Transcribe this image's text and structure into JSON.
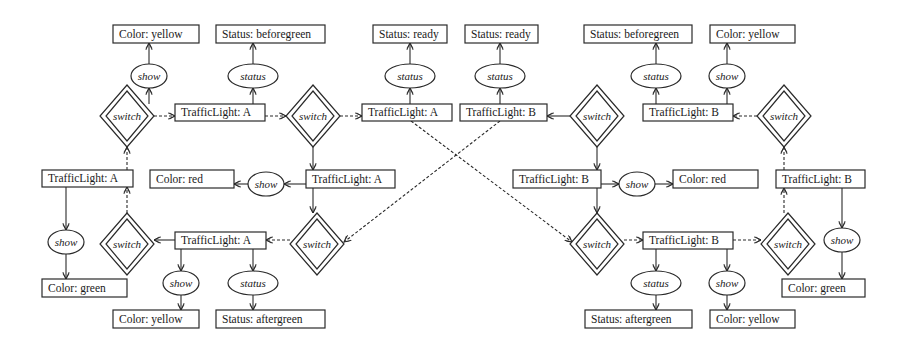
{
  "diagram": {
    "colors": {
      "stroke": "#2a2a2a",
      "background": "#ffffff",
      "text": "#1a1a1a"
    },
    "nodes": {
      "n1": {
        "type": "box",
        "label": "Color: yellow",
        "x": 113,
        "y": 25,
        "w": 86,
        "h": 18
      },
      "n2": {
        "type": "box",
        "label": "Status: beforegreen",
        "x": 216,
        "y": 25,
        "w": 109,
        "h": 18
      },
      "n3": {
        "type": "box",
        "label": "Status: ready",
        "x": 373,
        "y": 25,
        "w": 74,
        "h": 18
      },
      "n4": {
        "type": "box",
        "label": "Status: ready",
        "x": 465,
        "y": 25,
        "w": 73,
        "h": 18
      },
      "n5": {
        "type": "box",
        "label": "Status: beforegreen",
        "x": 584,
        "y": 25,
        "w": 108,
        "h": 18
      },
      "n6": {
        "type": "box",
        "label": "Color: yellow",
        "x": 710,
        "y": 25,
        "w": 85,
        "h": 18
      },
      "o1": {
        "type": "op",
        "label": "show",
        "cx": 149,
        "cy": 76,
        "rx": 18,
        "ry": 12
      },
      "o2": {
        "type": "op",
        "label": "status",
        "cx": 253,
        "cy": 76,
        "rx": 25,
        "ry": 12
      },
      "o3": {
        "type": "op",
        "label": "status",
        "cx": 410,
        "cy": 76,
        "rx": 25,
        "ry": 12
      },
      "o4": {
        "type": "op",
        "label": "status",
        "cx": 500,
        "cy": 76,
        "rx": 25,
        "ry": 12
      },
      "o5": {
        "type": "op",
        "label": "status",
        "cx": 656,
        "cy": 76,
        "rx": 25,
        "ry": 12
      },
      "o6": {
        "type": "op",
        "label": "show",
        "cx": 727,
        "cy": 76,
        "rx": 18,
        "ry": 12
      },
      "t1": {
        "type": "box",
        "label": "TrafficLight: A",
        "x": 175,
        "y": 104,
        "w": 90,
        "h": 17
      },
      "t2": {
        "type": "box",
        "label": "TrafficLight: A",
        "x": 362,
        "y": 104,
        "w": 90,
        "h": 17
      },
      "t3": {
        "type": "box",
        "label": "TrafficLight: B",
        "x": 460,
        "y": 104,
        "w": 87,
        "h": 17
      },
      "t4": {
        "type": "box",
        "label": "TrafficLight: B",
        "x": 643,
        "y": 104,
        "w": 90,
        "h": 17
      },
      "s1": {
        "type": "switch",
        "label": "switch",
        "cx": 127,
        "cy": 116
      },
      "s2": {
        "type": "switch",
        "label": "switch",
        "cx": 313,
        "cy": 116
      },
      "s3": {
        "type": "switch",
        "label": "switch",
        "cx": 597,
        "cy": 116
      },
      "s4": {
        "type": "switch",
        "label": "switch",
        "cx": 784,
        "cy": 116
      },
      "t5": {
        "type": "box",
        "label": "TrafficLight: A",
        "x": 42,
        "y": 170,
        "w": 91,
        "h": 17
      },
      "n7": {
        "type": "box",
        "label": "Color: red",
        "x": 150,
        "y": 170,
        "w": 84,
        "h": 18
      },
      "o7": {
        "type": "op",
        "label": "show",
        "cx": 266,
        "cy": 184,
        "rx": 18,
        "ry": 12
      },
      "t6": {
        "type": "box",
        "label": "TrafficLight: A",
        "x": 306,
        "y": 170,
        "w": 89,
        "h": 18
      },
      "t7": {
        "type": "box",
        "label": "TrafficLight: B",
        "x": 513,
        "y": 170,
        "w": 88,
        "h": 18
      },
      "o8": {
        "type": "op",
        "label": "show",
        "cx": 637,
        "cy": 184,
        "rx": 18,
        "ry": 12
      },
      "n8": {
        "type": "box",
        "label": "Color: red",
        "x": 673,
        "y": 170,
        "w": 85,
        "h": 18
      },
      "t8": {
        "type": "box",
        "label": "TrafficLight: B",
        "x": 776,
        "y": 170,
        "w": 89,
        "h": 18
      },
      "o9": {
        "type": "op",
        "label": "show",
        "cx": 66,
        "cy": 242,
        "rx": 18,
        "ry": 12
      },
      "s5": {
        "type": "switch",
        "label": "switch",
        "cx": 127,
        "cy": 244
      },
      "t9": {
        "type": "box",
        "label": "TrafficLight: A",
        "x": 175,
        "y": 232,
        "w": 91,
        "h": 17
      },
      "s6": {
        "type": "switch",
        "label": "switch",
        "cx": 317,
        "cy": 244
      },
      "s7": {
        "type": "switch",
        "label": "switch",
        "cx": 597,
        "cy": 244
      },
      "t10": {
        "type": "box",
        "label": "TrafficLight: B",
        "x": 643,
        "y": 232,
        "w": 90,
        "h": 17
      },
      "s8": {
        "type": "switch",
        "label": "switch",
        "cx": 788,
        "cy": 244
      },
      "o10": {
        "type": "op",
        "label": "show",
        "cx": 842,
        "cy": 240,
        "rx": 18,
        "ry": 12
      },
      "n9": {
        "type": "box",
        "label": "Color: green",
        "x": 42,
        "y": 279,
        "w": 85,
        "h": 18
      },
      "n10": {
        "type": "box",
        "label": "Color: green",
        "x": 782,
        "y": 279,
        "w": 83,
        "h": 18
      },
      "o11": {
        "type": "op",
        "label": "show",
        "cx": 181,
        "cy": 283,
        "rx": 18,
        "ry": 12
      },
      "o12": {
        "type": "op",
        "label": "status",
        "cx": 253,
        "cy": 283,
        "rx": 25,
        "ry": 12
      },
      "o13": {
        "type": "op",
        "label": "status",
        "cx": 656,
        "cy": 283,
        "rx": 25,
        "ry": 12
      },
      "o14": {
        "type": "op",
        "label": "show",
        "cx": 727,
        "cy": 283,
        "rx": 18,
        "ry": 12
      },
      "n11": {
        "type": "box",
        "label": "Color: yellow",
        "x": 113,
        "y": 310,
        "w": 86,
        "h": 18
      },
      "n12": {
        "type": "box",
        "label": "Status: aftergreen",
        "x": 216,
        "y": 310,
        "w": 109,
        "h": 18
      },
      "n13": {
        "type": "box",
        "label": "Status: aftergreen",
        "x": 585,
        "y": 310,
        "w": 107,
        "h": 18
      },
      "n14": {
        "type": "box",
        "label": "Color: yellow",
        "x": 710,
        "y": 310,
        "w": 85,
        "h": 18
      }
    },
    "edges": [
      {
        "from": [
          149,
          104
        ],
        "to": [
          149,
          88
        ],
        "style": "solid"
      },
      {
        "from": [
          149,
          64
        ],
        "to": [
          149,
          43
        ],
        "style": "solid"
      },
      {
        "from": [
          253,
          104
        ],
        "to": [
          253,
          88
        ],
        "style": "solid"
      },
      {
        "from": [
          253,
          64
        ],
        "to": [
          253,
          43
        ],
        "style": "solid"
      },
      {
        "from": [
          410,
          104
        ],
        "to": [
          410,
          88
        ],
        "style": "solid"
      },
      {
        "from": [
          410,
          64
        ],
        "to": [
          410,
          43
        ],
        "style": "solid"
      },
      {
        "from": [
          500,
          104
        ],
        "to": [
          500,
          88
        ],
        "style": "solid"
      },
      {
        "from": [
          500,
          64
        ],
        "to": [
          500,
          43
        ],
        "style": "solid"
      },
      {
        "from": [
          656,
          104
        ],
        "to": [
          656,
          88
        ],
        "style": "solid"
      },
      {
        "from": [
          656,
          64
        ],
        "to": [
          656,
          43
        ],
        "style": "solid"
      },
      {
        "from": [
          727,
          104
        ],
        "to": [
          727,
          88
        ],
        "style": "solid"
      },
      {
        "from": [
          727,
          64
        ],
        "to": [
          727,
          43
        ],
        "style": "solid"
      },
      {
        "from": [
          154,
          116
        ],
        "to": [
          175,
          116
        ],
        "style": "dashed"
      },
      {
        "from": [
          265,
          116
        ],
        "to": [
          286,
          116
        ],
        "style": "dashed"
      },
      {
        "from": [
          340,
          116
        ],
        "to": [
          362,
          116
        ],
        "style": "dashed"
      },
      {
        "from": [
          570,
          116
        ],
        "to": [
          547,
          116
        ],
        "style": "solid"
      },
      {
        "from": [
          757,
          116
        ],
        "to": [
          733,
          116
        ],
        "style": "dashed"
      },
      {
        "from": [
          127,
          170
        ],
        "to": [
          127,
          147
        ],
        "style": "dashed"
      },
      {
        "from": [
          313,
          147
        ],
        "to": [
          313,
          170
        ],
        "style": "solid"
      },
      {
        "from": [
          597,
          147
        ],
        "to": [
          597,
          170
        ],
        "style": "solid"
      },
      {
        "from": [
          784,
          170
        ],
        "to": [
          784,
          147
        ],
        "style": "dashed"
      },
      {
        "from": [
          306,
          184
        ],
        "to": [
          284,
          184
        ],
        "style": "solid"
      },
      {
        "from": [
          248,
          184
        ],
        "to": [
          234,
          184
        ],
        "style": "solid"
      },
      {
        "from": [
          601,
          184
        ],
        "to": [
          619,
          184
        ],
        "style": "solid"
      },
      {
        "from": [
          655,
          184
        ],
        "to": [
          673,
          184
        ],
        "style": "solid"
      },
      {
        "from": [
          66,
          187
        ],
        "to": [
          66,
          230
        ],
        "style": "solid"
      },
      {
        "from": [
          66,
          254
        ],
        "to": [
          66,
          279
        ],
        "style": "solid"
      },
      {
        "from": [
          842,
          188
        ],
        "to": [
          842,
          228
        ],
        "style": "solid"
      },
      {
        "from": [
          842,
          252
        ],
        "to": [
          842,
          279
        ],
        "style": "solid"
      },
      {
        "from": [
          127,
          213
        ],
        "to": [
          127,
          187
        ],
        "style": "dashed"
      },
      {
        "from": [
          175,
          240
        ],
        "to": [
          154,
          240
        ],
        "style": "solid"
      },
      {
        "from": [
          290,
          240
        ],
        "to": [
          266,
          240
        ],
        "style": "dashed"
      },
      {
        "from": [
          313,
          188
        ],
        "to": [
          313,
          213
        ],
        "style": "solid"
      },
      {
        "from": [
          597,
          188
        ],
        "to": [
          597,
          213
        ],
        "style": "solid"
      },
      {
        "from": [
          624,
          240
        ],
        "to": [
          643,
          240
        ],
        "style": "dashed"
      },
      {
        "from": [
          733,
          240
        ],
        "to": [
          761,
          240
        ],
        "style": "dashed"
      },
      {
        "from": [
          784,
          213
        ],
        "to": [
          784,
          188
        ],
        "style": "dashed"
      },
      {
        "from": [
          181,
          249
        ],
        "to": [
          181,
          271
        ],
        "style": "solid"
      },
      {
        "from": [
          181,
          295
        ],
        "to": [
          181,
          310
        ],
        "style": "solid"
      },
      {
        "from": [
          253,
          249
        ],
        "to": [
          253,
          271
        ],
        "style": "solid"
      },
      {
        "from": [
          253,
          295
        ],
        "to": [
          253,
          310
        ],
        "style": "solid"
      },
      {
        "from": [
          656,
          249
        ],
        "to": [
          656,
          271
        ],
        "style": "solid"
      },
      {
        "from": [
          656,
          295
        ],
        "to": [
          656,
          310
        ],
        "style": "solid"
      },
      {
        "from": [
          727,
          249
        ],
        "to": [
          727,
          271
        ],
        "style": "solid"
      },
      {
        "from": [
          727,
          295
        ],
        "to": [
          727,
          310
        ],
        "style": "solid"
      },
      {
        "from": [
          411,
          121
        ],
        "to": [
          572,
          242
        ],
        "style": "dashed"
      },
      {
        "from": [
          500,
          121
        ],
        "to": [
          344,
          242
        ],
        "style": "dashed"
      }
    ]
  }
}
